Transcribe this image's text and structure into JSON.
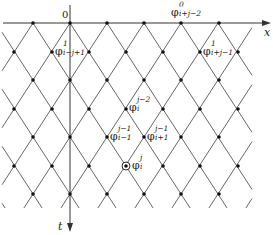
{
  "diagram": {
    "type": "characteristic-lattice",
    "colors": {
      "line": "#555555",
      "node": "#111111",
      "axis": "#333333",
      "background": "#ffffff"
    },
    "axes": {
      "x": {
        "label": "x",
        "origin_label": "0"
      },
      "t": {
        "label": "t"
      }
    },
    "lattice": {
      "even_row_x": [
        33,
        70,
        107,
        144,
        181,
        219
      ],
      "odd_row_x": [
        14,
        52,
        89,
        126,
        163,
        200,
        238
      ],
      "row_y": [
        23,
        52,
        80,
        109,
        137,
        166,
        194
      ],
      "circled_node": {
        "row": 5,
        "x": 126
      }
    },
    "labels": [
      {
        "id": "phi-0-i+j-2",
        "symbol": "φ",
        "sup": "0",
        "sub": "i+j−2",
        "x": 171,
        "y": 3
      },
      {
        "id": "phi-1-i-j+1",
        "symbol": "φ",
        "sup": "1",
        "sub": "i−j+1",
        "x": 55,
        "y": 42
      },
      {
        "id": "phi-1-i+j-1",
        "symbol": "φ",
        "sup": "1",
        "sub": "i+j−1",
        "x": 203,
        "y": 42
      },
      {
        "id": "phi-j-2-i",
        "symbol": "φ",
        "sup": "j−2",
        "sub": "i",
        "x": 129,
        "y": 98
      },
      {
        "id": "phi-j-1-i-1",
        "symbol": "φ",
        "sup": "j−1",
        "sub": "i−1",
        "x": 110,
        "y": 127
      },
      {
        "id": "phi-j-1-i+1",
        "symbol": "φ",
        "sup": "j−1",
        "sub": "i+1",
        "x": 147,
        "y": 127
      },
      {
        "id": "phi-j-i",
        "symbol": "φ",
        "sup": "j",
        "sub": "i",
        "x": 132,
        "y": 156
      }
    ]
  }
}
